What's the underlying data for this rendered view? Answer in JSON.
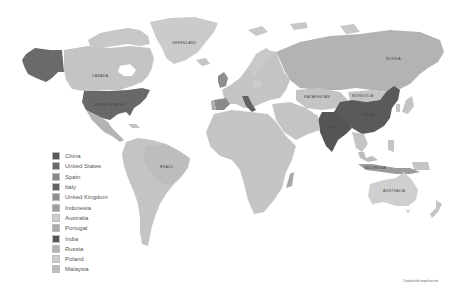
{
  "map": {
    "type": "choropleth-world-map",
    "colors": {
      "background": "#ffffff",
      "default_country": "#c4c4c4",
      "light_country": "#dadada",
      "dark": "#5c5c5c",
      "medium_dark": "#7a7a7a",
      "medium": "#9a9a9a"
    },
    "region_labels": {
      "canada": "CANADA",
      "united_states": "UNITED STATES",
      "greenland": "GREENLAND",
      "russia": "RUSSIA",
      "brazil": "BRAZIL",
      "australia": "AUSTRALIA",
      "china": "CHINA",
      "india": "INDIA",
      "indonesia": "INDONESIA",
      "kazakhstan": "KAZAKHSTAN",
      "mongolia": "MONGOLIA"
    }
  },
  "legend": {
    "items": [
      {
        "label": "China",
        "color": "#5a5a5a"
      },
      {
        "label": "United States",
        "color": "#686868"
      },
      {
        "label": "Spain",
        "color": "#8a8a8a"
      },
      {
        "label": "Italy",
        "color": "#626262"
      },
      {
        "label": "United Kingdom",
        "color": "#8e8e8e"
      },
      {
        "label": "Indonesia",
        "color": "#9c9c9c"
      },
      {
        "label": "Australia",
        "color": "#cfcfcf"
      },
      {
        "label": "Portugal",
        "color": "#ababab"
      },
      {
        "label": "India",
        "color": "#555555"
      },
      {
        "label": "Russia",
        "color": "#b3b3b3"
      },
      {
        "label": "Poland",
        "color": "#cccccc"
      },
      {
        "label": "Malaysia",
        "color": "#bcbcbc"
      }
    ]
  },
  "footer": {
    "credit": "Created with mapchart.net"
  }
}
